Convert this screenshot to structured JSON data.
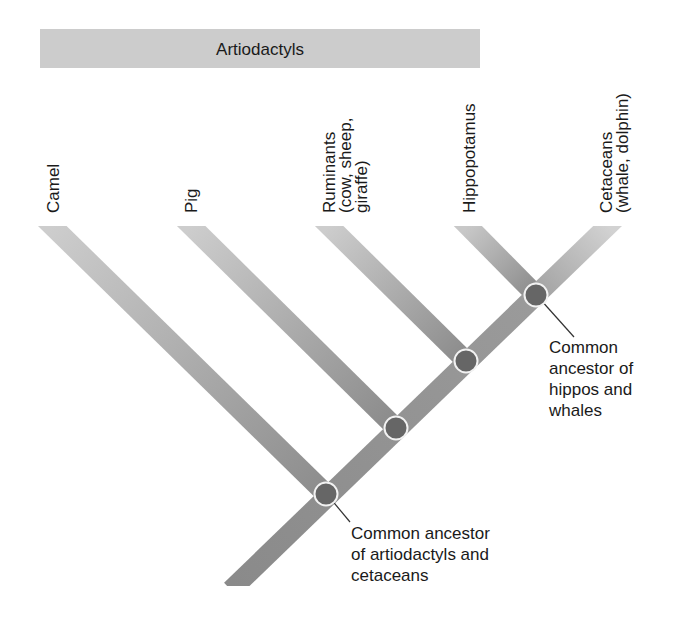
{
  "banner": {
    "label": "Artiodactyls"
  },
  "taxa": [
    {
      "name": "Camel",
      "lines": [
        "Camel"
      ]
    },
    {
      "name": "Pig",
      "lines": [
        "Pig"
      ]
    },
    {
      "name": "Ruminants",
      "lines": [
        "Ruminants",
        "(cow, sheep,",
        "giraffe)"
      ]
    },
    {
      "name": "Hippopotamus",
      "lines": [
        "Hippopotamus"
      ]
    },
    {
      "name": "Cetaceans",
      "lines": [
        "Cetaceans",
        "(whale, dolphin)"
      ]
    }
  ],
  "annotations": {
    "hippo_whale": [
      "Common",
      "ancestor of",
      "hippos and",
      "whales"
    ],
    "artio_cet": [
      "Common ancestor",
      "of artiodactyls and",
      "cetaceans"
    ]
  },
  "colors": {
    "banner_fill": "#cccccc",
    "branch_light": "#c8c8c8",
    "branch_dark": "#8a8a8a",
    "node_fill": "#666666",
    "node_stroke": "#f2f2f2",
    "text": "#1a1a1a"
  }
}
